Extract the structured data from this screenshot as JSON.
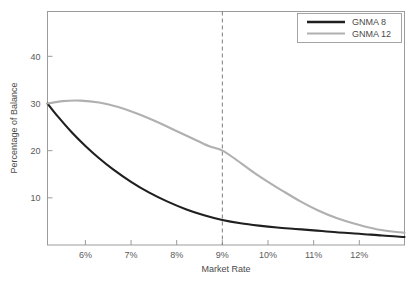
{
  "chart_data": {
    "type": "line",
    "title": "",
    "xlabel": "Market Rate",
    "ylabel": "Percentage of Balance",
    "xlim": [
      5.17,
      12.99
    ],
    "ylim": [
      0,
      49.5
    ],
    "xticks": [
      6,
      7,
      8,
      9,
      10,
      11,
      12
    ],
    "xtick_labels": [
      "6%",
      "7%",
      "8%",
      "9%",
      "10%",
      "11%",
      "12%"
    ],
    "yticks": [
      10,
      20,
      30,
      40
    ],
    "ytick_labels": [
      "10",
      "20",
      "30",
      "40"
    ],
    "grid": false,
    "legend_position": "top-right",
    "annotations": [
      {
        "name": "reference-line-9-percent",
        "type": "vertical-dashed-line",
        "x": 9,
        "label": ""
      }
    ],
    "series": [
      {
        "name": "GNMA 8",
        "color": "#1f1f1f",
        "linewidth": 2.1,
        "x": [
          5.17,
          5.4,
          5.7,
          6.0,
          6.3,
          6.6,
          7.0,
          7.4,
          7.8,
          8.2,
          8.6,
          9.0,
          9.4,
          9.8,
          10.2,
          10.6,
          11.0,
          11.5,
          12.0,
          12.5,
          12.99
        ],
        "values": [
          30.0,
          27.2,
          23.9,
          21.0,
          18.4,
          16.1,
          13.4,
          11.1,
          9.2,
          7.6,
          6.3,
          5.3,
          4.6,
          4.1,
          3.7,
          3.4,
          3.1,
          2.7,
          2.4,
          2.0,
          1.7
        ]
      },
      {
        "name": "GNMA 12",
        "color": "#b0b0b0",
        "linewidth": 2.1,
        "x": [
          5.17,
          5.5,
          5.9,
          6.3,
          6.7,
          7.1,
          7.5,
          7.9,
          8.3,
          8.7,
          9.0,
          9.3,
          9.7,
          10.0,
          10.3,
          10.7,
          11.1,
          11.5,
          11.9,
          12.4,
          12.99
        ],
        "values": [
          30.0,
          30.5,
          30.6,
          30.2,
          29.3,
          28.0,
          26.4,
          24.6,
          22.8,
          21.0,
          20.0,
          18.1,
          15.3,
          13.4,
          11.6,
          9.3,
          7.3,
          5.7,
          4.5,
          3.3,
          2.6
        ]
      }
    ]
  },
  "legend": {
    "entries": [
      {
        "label": "GNMA 8",
        "color": "#1f1f1f"
      },
      {
        "label": "GNMA 12",
        "color": "#b0b0b0"
      }
    ]
  },
  "axes": {
    "x_title": "Market Rate",
    "y_title": "Percentage of Balance",
    "x_labels": [
      "6%",
      "7%",
      "8%",
      "9%",
      "10%",
      "11%",
      "12%"
    ],
    "y_labels": [
      "40",
      "30",
      "20",
      "10"
    ]
  },
  "colors": {
    "frame": "#9b9b9b",
    "text": "#555555",
    "series_dark": "#1f1f1f",
    "series_light": "#b0b0b0",
    "dashed": "#7d7d7d",
    "background": "#ffffff"
  }
}
